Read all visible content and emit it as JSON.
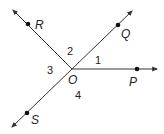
{
  "diagram": {
    "type": "rays from a common vertex",
    "vertex": {
      "label": "O",
      "x": 72,
      "y": 69
    },
    "rays": [
      {
        "name": "ray-OR",
        "point_label": "R",
        "dot": [
          28,
          24
        ],
        "tip": [
          13,
          10
        ]
      },
      {
        "name": "ray-OQ",
        "point_label": "Q",
        "dot": [
          118,
          25
        ],
        "tip": [
          132,
          11
        ]
      },
      {
        "name": "ray-OP",
        "point_label": "P",
        "dot": [
          137,
          69
        ],
        "tip": [
          157,
          69
        ]
      },
      {
        "name": "ray-OS",
        "point_label": "S",
        "dot": [
          27,
          113
        ],
        "tip": [
          12,
          127
        ]
      }
    ],
    "point_labels": {
      "R": "R",
      "Q": "Q",
      "P": "P",
      "S": "S",
      "O": "O"
    },
    "angle_labels": {
      "a1": "1",
      "a2": "2",
      "a3": "3",
      "a4": "4"
    },
    "colors": {
      "stroke": "#333333",
      "text": "#222222"
    }
  }
}
